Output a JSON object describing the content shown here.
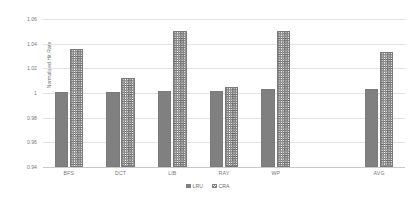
{
  "chart_data": {
    "type": "bar",
    "title": "",
    "xlabel": "",
    "ylabel": "Normalized Hit Rate",
    "ylim": [
      0.94,
      1.06
    ],
    "ytick_step": 0.02,
    "yticks": [
      "0.94",
      "0.96",
      "0.98",
      "1",
      "1.02",
      "1.04",
      "1.06"
    ],
    "grid": true,
    "legend_position": "bottom-center",
    "categories": [
      "BFS",
      "DCT",
      "LIB",
      "RAY",
      "WP",
      "AVG"
    ],
    "series": [
      {
        "name": "LRU",
        "pattern": "solid-gray",
        "color": "#808080",
        "values": [
          1.001,
          1.001,
          1.002,
          1.002,
          1.003,
          1.003
        ]
      },
      {
        "name": "CRA",
        "pattern": "cross-hatch",
        "color": "#6e6e6e",
        "values": [
          1.036,
          1.012,
          1.05,
          1.005,
          1.05,
          1.033
        ]
      }
    ]
  },
  "legend": {
    "items": [
      {
        "label": "LRU"
      },
      {
        "label": "CRA"
      }
    ]
  },
  "colors": {
    "grid": "#e3e3e3",
    "axis": "#c9c9c9",
    "text": "#777777",
    "bar_lru": "#808080",
    "bar_cra_hatch": "#6e6e6e"
  }
}
